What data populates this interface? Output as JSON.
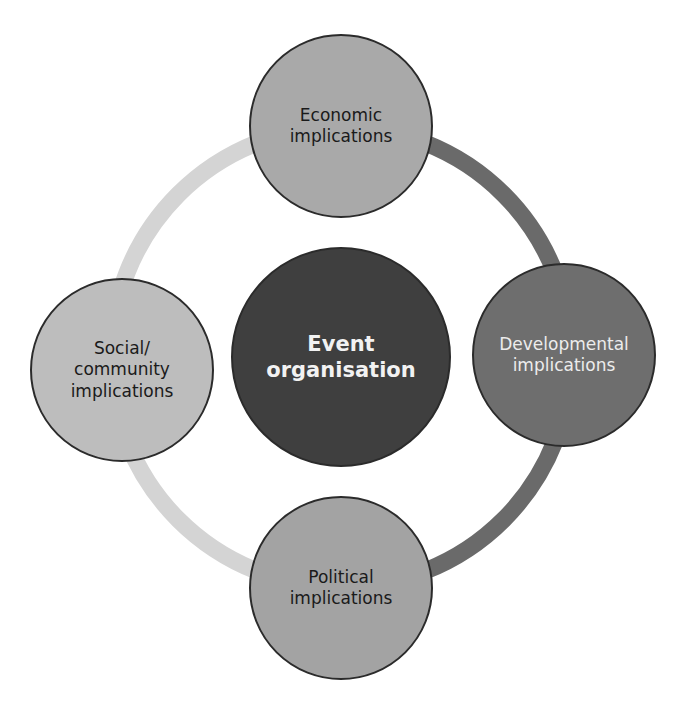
{
  "diagram": {
    "type": "hub-and-spoke cycle",
    "center": {
      "label": "Event organisation",
      "lines": [
        "Event",
        "organisation"
      ],
      "fill": "#3f3f3f"
    },
    "nodes": [
      {
        "position": "top",
        "label": "Economic implications",
        "lines": [
          "Economic",
          "implications"
        ],
        "fill": "#a9a9a9"
      },
      {
        "position": "right",
        "label": "Developmental implications",
        "lines": [
          "Developmental",
          "implications"
        ],
        "fill": "#6e6e6e"
      },
      {
        "position": "bottom",
        "label": "Political implications",
        "lines": [
          "Political",
          "implications"
        ],
        "fill": "#a3a3a3"
      },
      {
        "position": "left",
        "label": "Social/community implications",
        "lines": [
          "Social/",
          "community",
          "implications"
        ],
        "fill": "#bdbdbd"
      }
    ],
    "ring": {
      "left_color": "#d6d6d6",
      "right_color": "#6a6a6a"
    }
  }
}
